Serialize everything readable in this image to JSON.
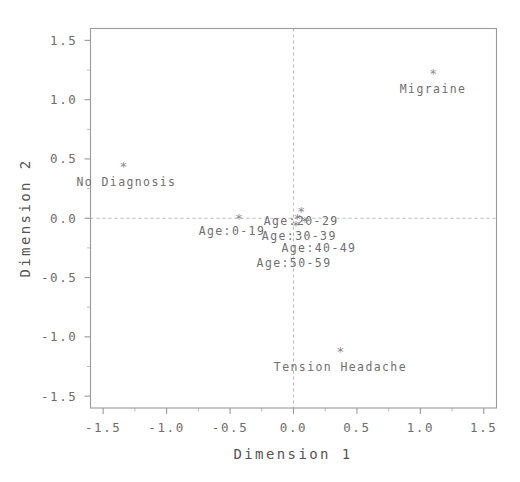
{
  "chart_data": {
    "type": "scatter",
    "title": "",
    "xlabel": "Dimension 1",
    "ylabel": "Dimension 2",
    "xlim": [
      -1.6,
      1.6
    ],
    "ylim": [
      -1.6,
      1.6
    ],
    "xticks": [
      "-1.5",
      "-1.0",
      "-0.5",
      "0.0",
      "0.5",
      "1.0",
      "1.5"
    ],
    "xtickvalues": [
      -1.5,
      -1.0,
      -0.5,
      0.0,
      0.5,
      1.0,
      1.5
    ],
    "yticks": [
      "1.5",
      "1.0",
      "0.5",
      "0.0",
      "-0.5",
      "-1.0",
      "-1.5"
    ],
    "ytickvalues": [
      1.5,
      1.0,
      0.5,
      0.0,
      -0.5,
      -1.0,
      -1.5
    ],
    "grid": false,
    "legend": "none",
    "marker_glyph": "*",
    "reference_lines": [
      {
        "axis": "vertical",
        "value": 0.0,
        "style": "dashed"
      },
      {
        "axis": "horizontal",
        "value": 0.0,
        "style": "dashed"
      }
    ],
    "points": [
      {
        "label": "Migraine",
        "x": 1.1,
        "y": 1.22,
        "label_dx": 0,
        "label_dy": 19,
        "anchor": "middle"
      },
      {
        "label": "No Diagnosis",
        "x": -1.34,
        "y": 0.44,
        "label_dx": 3,
        "label_dy": 20,
        "anchor": "middle"
      },
      {
        "label": "Tension Headache",
        "x": 0.37,
        "y": -1.12,
        "label_dx": 0,
        "label_dy": 20,
        "anchor": "middle"
      },
      {
        "label": "Age:0-19",
        "x": -0.43,
        "y": 0.0,
        "label_dx": -7,
        "label_dy": 17,
        "anchor": "middle"
      },
      {
        "label": "Age:20-29",
        "x": 0.06,
        "y": 0.06,
        "label_dx": 0,
        "label_dy": 14,
        "anchor": "middle"
      },
      {
        "label": "Age:30-39",
        "x": 0.03,
        "y": 0.0,
        "label_dx": 2,
        "label_dy": 22,
        "anchor": "middle"
      },
      {
        "label": "Age:40-49",
        "x": 0.09,
        "y": -0.03,
        "label_dx": 14,
        "label_dy": 30,
        "anchor": "middle"
      },
      {
        "label": "Age:50-59",
        "x": 0.02,
        "y": -0.06,
        "label_dx": -2,
        "label_dy": 42,
        "anchor": "middle"
      }
    ]
  },
  "axes": {
    "x_title": "Dimension 1",
    "y_title": "Dimension 2"
  },
  "colors": {
    "background": "#ffffff",
    "frame": "#9a9a9a",
    "text": "#6d6d6d",
    "marker": "#8a8a8a",
    "zeroline": "#b9b9b9"
  }
}
